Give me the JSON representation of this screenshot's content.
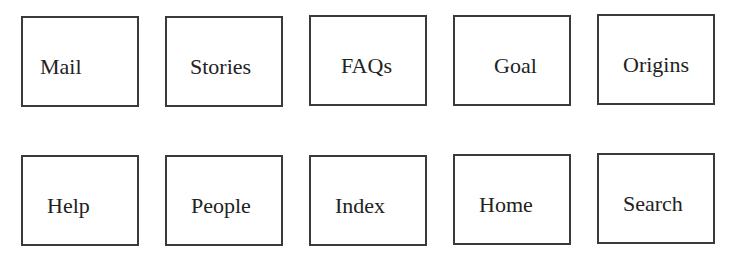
{
  "rows": [
    {
      "items": [
        {
          "label": "Mail",
          "x": 21,
          "y": 16,
          "text_offset": 18
        },
        {
          "label": "Stories",
          "x": 165,
          "y": 16,
          "text_offset": 24
        },
        {
          "label": "FAQs",
          "x": 309,
          "y": 15,
          "text_offset": 30
        },
        {
          "label": "Goal",
          "x": 453,
          "y": 15,
          "text_offset": 40
        },
        {
          "label": "Origins",
          "x": 597,
          "y": 14,
          "text_offset": 24
        }
      ]
    },
    {
      "items": [
        {
          "label": "Help",
          "x": 21,
          "y": 155,
          "text_offset": 24
        },
        {
          "label": "People",
          "x": 165,
          "y": 155,
          "text_offset": 24
        },
        {
          "label": "Index",
          "x": 309,
          "y": 155,
          "text_offset": 24
        },
        {
          "label": "Home",
          "x": 453,
          "y": 154,
          "text_offset": 24
        },
        {
          "label": "Search",
          "x": 597,
          "y": 153,
          "text_offset": 24
        }
      ]
    }
  ]
}
